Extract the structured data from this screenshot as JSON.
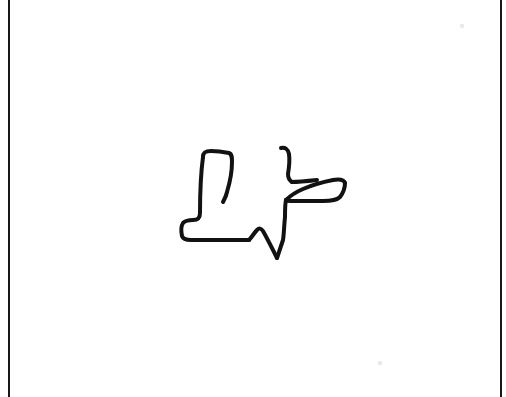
{
  "page": {
    "width": 506,
    "height": 397,
    "background_color": "#ffffff",
    "title": "Hand-drawn outline sketch on white paper"
  },
  "frame": {
    "left_rule_x": 8,
    "right_rule_x": 500,
    "rule_color": "#181818",
    "rule_width": 2,
    "has_top_rule": false,
    "has_bottom_rule": false
  },
  "drawing": {
    "name": "abstract-figure-outline",
    "medium": "ink-pen",
    "stroke_color": "#121212",
    "stroke_width": 4,
    "fill": "none",
    "bounding_box": {
      "x": 180,
      "y": 146,
      "width": 168,
      "height": 116
    },
    "parts": [
      {
        "name": "boot-body",
        "label": "left boot-like L shape",
        "path": "M 203 157 C 203 152 206 151 211 151 C 218 151 224 152 229 153 C 232 154 232 157 232 162 C 232 172 230 182 227 192 C 226 197 224 200 223 202"
      },
      {
        "name": "boot-left-wall-and-foot",
        "label": "left wall descending to horizontal foot",
        "path": "M 203 157 C 201 172 200 192 200 213 C 200 218 198 220 193 220 C 189 220 185 221 183 223 C 181 226 181 231 182 236 C 183 239 186 240 191 240 C 210 240 232 240 249 240"
      },
      {
        "name": "ankle-notch",
        "label": "step up from foot to mid peak",
        "path": "M 249 240 C 252 237 254 233 257 230 C 259 228 261 228 263 231 C 267 238 272 248 277 258"
      },
      {
        "name": "v-notch",
        "label": "sharp V dip at bottom center",
        "path": "M 277 258 C 279 252 281 246 283 240 C 284 234 284 226 285 217 C 285 210 285 204 286 200"
      },
      {
        "name": "right-arm-upper",
        "label": "upper hook arm rising to the left tip",
        "path": "M 286 200 C 290 196 296 192 303 189 C 312 185 323 182 333 180 C 339 179 344 180 345 183"
      },
      {
        "name": "right-wedge-tip",
        "label": "right pointed wedge end",
        "path": "M 345 183 C 345 188 343 193 340 197 C 337 200 331 201 323 201 C 312 201 300 201 291 201 C 288 201 286 201 286 200"
      },
      {
        "name": "hook-hand",
        "label": "small hook at the top right",
        "path": "M 281 148 C 285 147 288 149 289 154 C 290 161 289 168 288 174 C 288 178 289 180 292 182"
      },
      {
        "name": "hook-stem",
        "label": "stem joining hook to arm",
        "path": "M 292 182 C 299 182 308 181 317 180"
      }
    ]
  },
  "artifacts": {
    "scan_marks": [
      {
        "name": "faint-mark-upper-right",
        "x": 462,
        "y": 26
      },
      {
        "name": "faint-mark-lower-right",
        "x": 380,
        "y": 363
      }
    ]
  }
}
